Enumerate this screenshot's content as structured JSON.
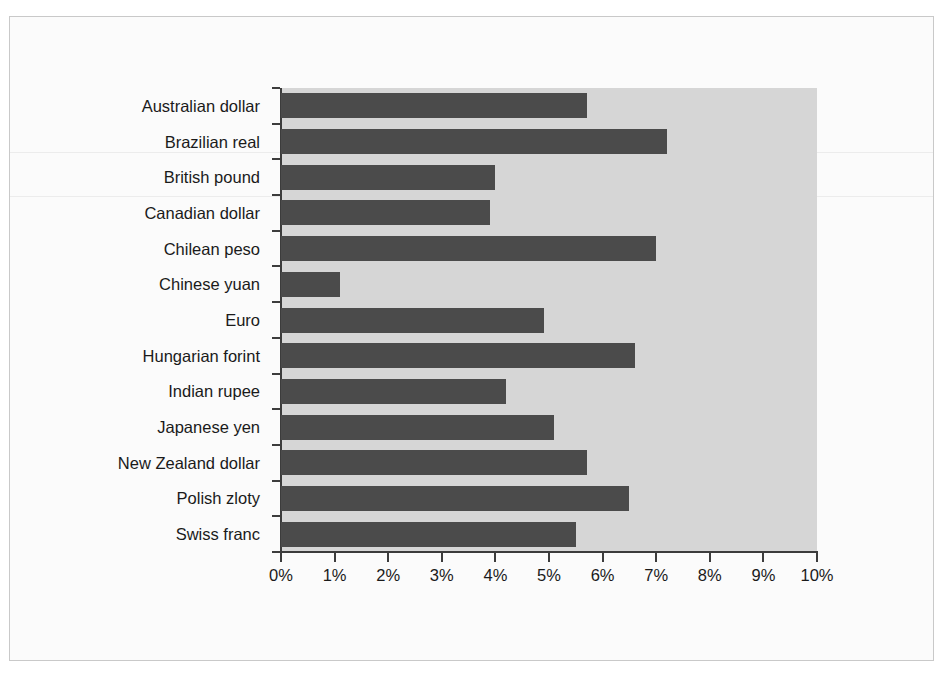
{
  "figure": {
    "title_fragment": "",
    "frame_color": "#c9c9c9",
    "panel_color": "#d6d6d6",
    "bar_color": "#4b4b4b",
    "axis_color": "#3c3c3c"
  },
  "chart_data": {
    "type": "bar",
    "orientation": "horizontal",
    "title": "",
    "xlabel": "",
    "ylabel": "",
    "xlim": [
      0,
      10
    ],
    "xtick_labels": [
      "0%",
      "1%",
      "2%",
      "3%",
      "4%",
      "5%",
      "6%",
      "7%",
      "8%",
      "9%",
      "10%"
    ],
    "xtick_values": [
      0,
      1,
      2,
      3,
      4,
      5,
      6,
      7,
      8,
      9,
      10
    ],
    "grid": false,
    "legend": null,
    "categories": [
      "Australian dollar",
      "Brazilian real",
      "British pound",
      "Canadian dollar",
      "Chilean peso",
      "Chinese yuan",
      "Euro",
      "Hungarian forint",
      "Indian rupee",
      "Japanese yen",
      "New Zealand dollar",
      "Polish zloty",
      "Swiss franc"
    ],
    "values": [
      5.7,
      7.2,
      4.0,
      3.9,
      7.0,
      1.1,
      4.9,
      6.6,
      4.2,
      5.1,
      5.7,
      6.5,
      5.5
    ],
    "value_labels": [
      "5.7%",
      "7.2%",
      "4.0%",
      "3.9%",
      "7.0%",
      "1.1%",
      "4.9%",
      "6.6%",
      "4.2%",
      "5.1%",
      "5.7%",
      "6.5%",
      "5.5%"
    ],
    "series": [
      {
        "name": "",
        "values": [
          5.7,
          7.2,
          4.0,
          3.9,
          7.0,
          1.1,
          4.9,
          6.6,
          4.2,
          5.1,
          5.7,
          6.5,
          5.5
        ]
      }
    ]
  }
}
